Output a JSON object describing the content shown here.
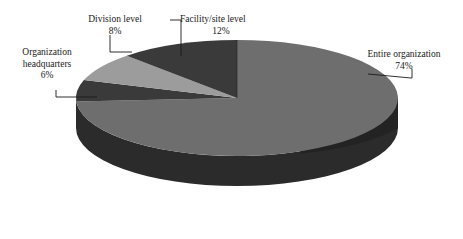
{
  "chart_data": {
    "type": "pie",
    "title": "",
    "subtitle": "",
    "xlabel": "",
    "ylabel": "",
    "grid": false,
    "legend_position": "none",
    "three_d": true,
    "start_angle_deg": 0,
    "direction": "clockwise",
    "categories": [
      "Entire organization",
      "Organization headquarters",
      "Division level",
      "Facility/site level"
    ],
    "values": [
      74,
      6,
      8,
      12
    ],
    "value_unit": "%",
    "slices": [
      {
        "label": "Entire organization",
        "value": 74,
        "value_text": "74%",
        "color": "#6e6e6e",
        "side_color": "#2b2b2b"
      },
      {
        "label": "Organization headquarters",
        "value": 6,
        "value_text": "6%",
        "color": "#3a3a3a",
        "side_color": "#232323"
      },
      {
        "label": "Division level",
        "value": 8,
        "value_text": "8%",
        "color": "#9c9c9c",
        "side_color": "#4a4a4a"
      },
      {
        "label": "Facility/site level",
        "value": 12,
        "value_text": "12%",
        "color": "#3a3a3a",
        "side_color": "#232323"
      }
    ]
  },
  "labels": {
    "division": {
      "name": "Division level",
      "pct": "8%"
    },
    "facility": {
      "name": "Facility/site level",
      "pct": "12%"
    },
    "headquarters": {
      "line1": "Organization",
      "line2": "headquarters",
      "pct": "6%"
    },
    "entire": {
      "name": "Entire organization",
      "pct": "74%"
    }
  },
  "colors": {
    "background": "#ffffff",
    "text": "#191919",
    "leader_line": "#1a1a1a",
    "slice_entire": "#6e6e6e",
    "slice_headquarters": "#3a3a3a",
    "slice_division": "#9c9c9c",
    "slice_facility": "#3a3a3a",
    "pie_side_wall": "#2b2b2b"
  }
}
